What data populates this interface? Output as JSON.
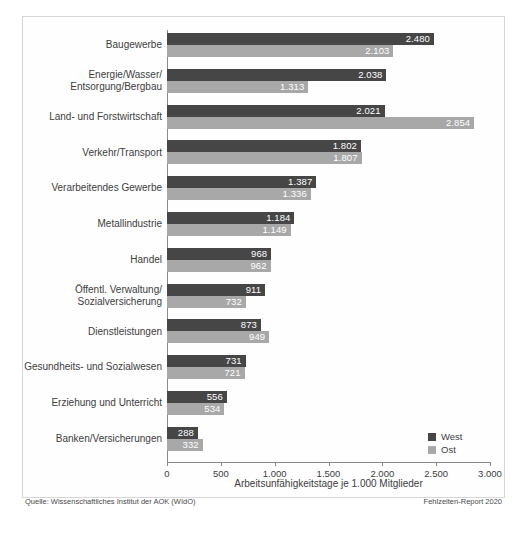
{
  "chart_data": {
    "type": "bar",
    "orientation": "horizontal",
    "title": "",
    "xlabel": "Arbeitsunfähigkeitstage je 1.000 Mitglieder",
    "ylabel": "",
    "xlim": [
      0,
      3000
    ],
    "grid": false,
    "legend_position": "bottom-right",
    "categories": [
      "Baugewerbe",
      "Energie/Wasser/\nEntsorgung/Bergbau",
      "Land- und Forstwirtschaft",
      "Verkehr/Transport",
      "Verarbeitendes Gewerbe",
      "Metallindustrie",
      "Handel",
      "Öffentl. Verwaltung/\nSozialversicherung",
      "Dienstleistungen",
      "Gesundheits- und Sozialwesen",
      "Erziehung und Unterricht",
      "Banken/Versicherungen"
    ],
    "series": [
      {
        "name": "West",
        "color": "#464646",
        "values": [
          2480,
          2038,
          2021,
          1802,
          1387,
          1184,
          968,
          911,
          873,
          731,
          556,
          288
        ],
        "labels": [
          "2.480",
          "2.038",
          "2.021",
          "1.802",
          "1.387",
          "1.184",
          "968",
          "911",
          "873",
          "731",
          "556",
          "288"
        ]
      },
      {
        "name": "Ost",
        "color": "#a8a8a8",
        "values": [
          2103,
          1313,
          2854,
          1807,
          1336,
          1149,
          962,
          732,
          949,
          721,
          534,
          332
        ],
        "labels": [
          "2.103",
          "1.313",
          "2.854",
          "1.807",
          "1.336",
          "1.149",
          "962",
          "732",
          "949",
          "721",
          "534",
          "332"
        ]
      }
    ],
    "xticks": [
      0,
      500,
      1000,
      1500,
      2000,
      2500,
      3000
    ],
    "xtick_labels": [
      "0",
      "500",
      "1.000",
      "1.500",
      "2.000",
      "2.500",
      "3.000"
    ]
  },
  "legend": {
    "items": [
      {
        "label": "West",
        "color": "#464646"
      },
      {
        "label": "Ost",
        "color": "#a8a8a8"
      }
    ]
  },
  "footer": {
    "source": "Quelle: Wissenschaftliches Institut der AOK (WIdO)",
    "report": "Fehlzeiten-Report 2020"
  },
  "colors": {
    "west": "#464646",
    "ost": "#a8a8a8",
    "axis": "#8a8a8a",
    "text": "#3d3d3d",
    "frame": "#d6d6d6",
    "background": "#ffffff"
  }
}
